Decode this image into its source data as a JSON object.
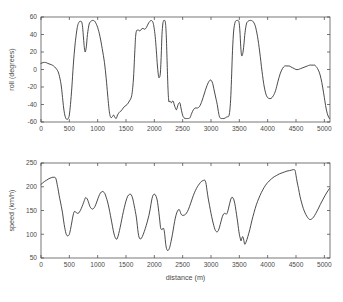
{
  "figure": {
    "background": "#ffffff",
    "line_color": "#2b2b2b",
    "axis_color": "#3c3c3c",
    "text_color": "#4a4a4a"
  },
  "chart_data": [
    {
      "type": "line",
      "id": "roll",
      "title": "",
      "xlabel": "",
      "ylabel": "roll (degrees)",
      "xlim": [
        0,
        5100
      ],
      "ylim": [
        -60,
        60
      ],
      "xticks": [
        0,
        500,
        1000,
        1500,
        2000,
        2500,
        3000,
        3500,
        4000,
        4500,
        5000
      ],
      "xticklabels": [
        "0",
        "500",
        "1000",
        "1500",
        "2000",
        "2500",
        "3000",
        "3500",
        "4000",
        "4500",
        "5000"
      ],
      "xticklabels_visible": true,
      "yticks": [
        -60,
        -40,
        -20,
        0,
        20,
        40,
        60
      ],
      "yticklabels": [
        "-60",
        "-40",
        "-20",
        "0",
        "20",
        "40",
        "60"
      ],
      "grid": false,
      "legend": null,
      "series": [
        {
          "name": "roll",
          "x": [
            0,
            40,
            80,
            120,
            160,
            200,
            240,
            280,
            310,
            340,
            360,
            380,
            400,
            420,
            440,
            460,
            480,
            500,
            520,
            545,
            570,
            600,
            640,
            670,
            690,
            705,
            720,
            735,
            750,
            765,
            780,
            800,
            820,
            850,
            880,
            905,
            930,
            960,
            1000,
            1040,
            1080,
            1120,
            1150,
            1175,
            1195,
            1210,
            1225,
            1240,
            1260,
            1280,
            1300,
            1320,
            1335,
            1350,
            1370,
            1395,
            1420,
            1450,
            1480,
            1520,
            1560,
            1600,
            1630,
            1655,
            1670,
            1685,
            1700,
            1720,
            1745,
            1770,
            1800,
            1830,
            1860,
            1890,
            1920,
            1950,
            1975,
            1995,
            2015,
            2035,
            2055,
            2075,
            2090,
            2105,
            2115,
            2125,
            2135,
            2150,
            2165,
            2180,
            2195,
            2210,
            2225,
            2240,
            2255,
            2275,
            2300,
            2330,
            2360,
            2390,
            2420,
            2450,
            2470,
            2490,
            2510,
            2540,
            2570,
            2600,
            2630,
            2660,
            2690,
            2720,
            2760,
            2800,
            2840,
            2880,
            2920,
            2960,
            2990,
            3010,
            3030,
            3050,
            3070,
            3090,
            3110,
            3130,
            3150,
            3175,
            3200,
            3230,
            3260,
            3285,
            3305,
            3320,
            3335,
            3350,
            3365,
            3380,
            3400,
            3425,
            3450,
            3475,
            3495,
            3510,
            3525,
            3540,
            3560,
            3580,
            3600,
            3625,
            3650,
            3680,
            3710,
            3740,
            3780,
            3820,
            3860,
            3900,
            3940,
            3980,
            4020,
            4060,
            4100,
            4140,
            4180,
            4220,
            4260,
            4300,
            4340,
            4380,
            4410,
            4440,
            4470,
            4500,
            4540,
            4580,
            4620,
            4660,
            4700,
            4740,
            4780,
            4810,
            4830,
            4845,
            4860,
            4880,
            4910,
            4940,
            4970,
            5000,
            5030,
            5060,
            5090
          ],
          "y": [
            7,
            8,
            8,
            7,
            6,
            5,
            3,
            0,
            -4,
            -12,
            -20,
            -32,
            -44,
            -52,
            -56,
            -57,
            -56,
            -52,
            -40,
            -20,
            5,
            28,
            48,
            54,
            55,
            55,
            54,
            48,
            36,
            25,
            20,
            26,
            40,
            52,
            55,
            56,
            56,
            54,
            48,
            38,
            24,
            8,
            -10,
            -28,
            -42,
            -50,
            -54,
            -55,
            -54,
            -52,
            -54,
            -56,
            -55,
            -52,
            -50,
            -48,
            -47,
            -44,
            -42,
            -40,
            -36,
            -30,
            -12,
            20,
            38,
            44,
            45,
            45,
            44,
            46,
            47,
            46,
            48,
            52,
            55,
            56,
            54,
            48,
            38,
            22,
            4,
            -8,
            -9,
            -5,
            6,
            22,
            40,
            52,
            56,
            56,
            54,
            40,
            10,
            -20,
            -36,
            -36,
            -38,
            -36,
            -42,
            -46,
            -40,
            -38,
            -44,
            -50,
            -54,
            -56,
            -56,
            -56,
            -55,
            -50,
            -46,
            -44,
            -44,
            -42,
            -36,
            -28,
            -20,
            -14,
            -12,
            -13,
            -16,
            -22,
            -28,
            -34,
            -40,
            -48,
            -54,
            -56,
            -56,
            -56,
            -55,
            -54,
            -54,
            -52,
            -45,
            -30,
            -5,
            22,
            44,
            54,
            56,
            56,
            54,
            44,
            26,
            16,
            18,
            28,
            42,
            52,
            55,
            56,
            56,
            55,
            50,
            38,
            20,
            -2,
            -20,
            -30,
            -33,
            -33,
            -30,
            -24,
            -14,
            -5,
            1,
            4,
            4,
            4,
            3,
            2,
            1,
            0,
            0,
            1,
            2,
            3,
            4,
            5,
            5,
            5,
            5,
            4,
            3,
            1,
            -3,
            -10,
            -20,
            -32,
            -44,
            -52,
            -56,
            -57,
            -57,
            -56,
            -53,
            -47,
            -48,
            -47,
            -45,
            -42,
            -38,
            -32,
            -22,
            -10,
            0,
            4,
            5
          ]
        }
      ]
    },
    {
      "type": "line",
      "id": "speed",
      "title": "",
      "xlabel": "distance (m)",
      "ylabel": "speed (km/h)",
      "xlim": [
        0,
        5100
      ],
      "ylim": [
        50,
        250
      ],
      "xticks": [
        0,
        500,
        1000,
        1500,
        2000,
        2500,
        3000,
        3500,
        4000,
        4500,
        5000
      ],
      "xticklabels": [
        "0",
        "500",
        "1000",
        "1500",
        "2000",
        "2500",
        "3000",
        "3500",
        "4000",
        "4500",
        "5000"
      ],
      "xticklabels_visible": true,
      "yticks": [
        50,
        100,
        150,
        200,
        250
      ],
      "yticklabels": [
        "50",
        "100",
        "150",
        "200",
        "250"
      ],
      "grid": false,
      "legend": null,
      "series": [
        {
          "name": "speed",
          "x": [
            0,
            30,
            60,
            100,
            140,
            180,
            210,
            235,
            255,
            270,
            285,
            300,
            320,
            340,
            360,
            380,
            395,
            410,
            425,
            440,
            460,
            480,
            500,
            520,
            545,
            560,
            575,
            590,
            610,
            630,
            655,
            680,
            710,
            740,
            765,
            785,
            805,
            825,
            845,
            865,
            890,
            915,
            940,
            965,
            990,
            1020,
            1050,
            1080,
            1105,
            1125,
            1150,
            1175,
            1200,
            1225,
            1250,
            1275,
            1295,
            1310,
            1325,
            1340,
            1360,
            1385,
            1410,
            1440,
            1470,
            1500,
            1530,
            1560,
            1585,
            1605,
            1625,
            1645,
            1665,
            1685,
            1700,
            1715,
            1730,
            1750,
            1775,
            1805,
            1840,
            1875,
            1905,
            1930,
            1950,
            1970,
            1990,
            2010,
            2030,
            2050,
            2065,
            2080,
            2095,
            2110,
            2125,
            2140,
            2155,
            2170,
            2185,
            2200,
            2220,
            2245,
            2270,
            2295,
            2320,
            2345,
            2370,
            2395,
            2420,
            2440,
            2455,
            2470,
            2490,
            2520,
            2550,
            2585,
            2620,
            2655,
            2690,
            2725,
            2760,
            2795,
            2830,
            2860,
            2885,
            2900,
            2915,
            2930,
            2950,
            2975,
            3000,
            3025,
            3050,
            3070,
            3090,
            3110,
            3130,
            3150,
            3175,
            3200,
            3225,
            3250,
            3270,
            3290,
            3310,
            3330,
            3350,
            3370,
            3390,
            3410,
            3430,
            3450,
            3470,
            3485,
            3500,
            3515,
            3530,
            3545,
            3560,
            3575,
            3595,
            3620,
            3650,
            3685,
            3720,
            3760,
            3800,
            3845,
            3890,
            3935,
            3980,
            4025,
            4070,
            4115,
            4160,
            4205,
            4250,
            4295,
            4340,
            4385,
            4420,
            4450,
            4470,
            4485,
            4500,
            4520,
            4545,
            4570,
            4600,
            4630,
            4660,
            4690,
            4720,
            4745,
            4775,
            4810,
            4850,
            4890,
            4930,
            4970,
            5010,
            5050,
            5090
          ],
          "y": [
            205,
            208,
            211,
            214,
            217,
            219,
            220,
            220,
            219,
            214,
            205,
            196,
            182,
            170,
            158,
            145,
            132,
            120,
            110,
            102,
            97,
            97,
            100,
            110,
            126,
            136,
            144,
            148,
            147,
            145,
            144,
            147,
            154,
            163,
            171,
            177,
            176,
            172,
            165,
            158,
            154,
            153,
            156,
            162,
            170,
            180,
            187,
            190,
            189,
            186,
            178,
            168,
            155,
            140,
            124,
            108,
            98,
            93,
            90,
            90,
            96,
            108,
            122,
            140,
            156,
            170,
            180,
            184,
            184,
            180,
            172,
            160,
            148,
            134,
            118,
            103,
            94,
            90,
            92,
            100,
            112,
            126,
            140,
            155,
            170,
            180,
            184,
            184,
            180,
            172,
            160,
            146,
            130,
            114,
            110,
            110,
            113,
            110,
            98,
            80,
            68,
            66,
            72,
            85,
            100,
            118,
            134,
            145,
            151,
            152,
            148,
            143,
            140,
            140,
            142,
            148,
            158,
            170,
            182,
            192,
            200,
            206,
            211,
            213,
            214,
            212,
            205,
            192,
            176,
            160,
            144,
            130,
            118,
            110,
            106,
            105,
            108,
            115,
            126,
            137,
            143,
            144,
            142,
            146,
            155,
            165,
            174,
            178,
            176,
            170,
            158,
            142,
            126,
            112,
            100,
            92,
            86,
            92,
            95,
            90,
            79,
            84,
            95,
            110,
            128,
            146,
            162,
            176,
            188,
            198,
            206,
            212,
            217,
            221,
            224,
            227,
            229,
            231,
            233,
            234,
            235,
            236,
            236,
            234,
            224,
            210,
            196,
            180,
            166,
            154,
            145,
            138,
            133,
            131,
            132,
            136,
            144,
            153,
            163,
            172,
            181,
            189,
            196,
            202,
            204
          ]
        }
      ]
    }
  ]
}
